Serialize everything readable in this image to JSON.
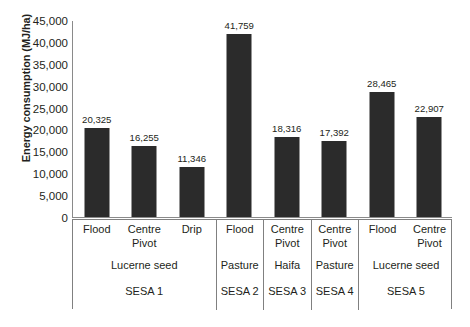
{
  "chart_data": {
    "type": "bar",
    "title": "",
    "xlabel": "",
    "ylabel": "Energy consumption (MJ/ha)",
    "ylim": [
      0,
      45000
    ],
    "ytick_labels": [
      "45,000",
      "40,000",
      "35,000",
      "30,000",
      "25,000",
      "20,000",
      "15,000",
      "10,000",
      "5,000",
      "0"
    ],
    "ytick_values": [
      45000,
      40000,
      35000,
      30000,
      25000,
      20000,
      15000,
      10000,
      5000,
      0
    ],
    "grid": false,
    "legend": "none",
    "bar_color": "#2b2b2b",
    "categories": [
      "Flood",
      "Centre Pivot",
      "Drip",
      "Flood",
      "Centre Pivot",
      "Centre Pivot",
      "Flood",
      "Centre Pivot"
    ],
    "values": [
      20325,
      16255,
      11346,
      41759,
      18316,
      17392,
      28465,
      22907
    ],
    "value_labels": [
      "20,325",
      "16,255",
      "11,346",
      "41,759",
      "18,316",
      "17,392",
      "28,465",
      "22,907"
    ],
    "groups": [
      {
        "sesa": "SESA 1",
        "crop": "Lucerne seed",
        "methods": [
          "Flood",
          "Centre Pivot",
          "Drip"
        ]
      },
      {
        "sesa": "SESA 2",
        "crop": "Pasture",
        "methods": [
          "Flood"
        ]
      },
      {
        "sesa": "SESA 3",
        "crop": "Haifa",
        "methods": [
          "Centre Pivot"
        ]
      },
      {
        "sesa": "SESA 4",
        "crop": "Pasture",
        "methods": [
          "Centre Pivot"
        ]
      },
      {
        "sesa": "SESA 5",
        "crop": "Lucerne seed",
        "methods": [
          "Flood",
          "Centre Pivot"
        ]
      }
    ]
  }
}
